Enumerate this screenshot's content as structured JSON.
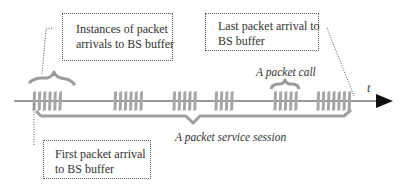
{
  "figure": {
    "type": "timeline-diagram",
    "axis": {
      "label": "t"
    },
    "callouts": {
      "instances": {
        "lines": [
          "Instances of packet",
          "arrivals to BS buffer"
        ]
      },
      "last": {
        "lines": [
          "Last packet arrival to",
          "BS buffer"
        ]
      },
      "first": {
        "lines": [
          "First packet arrival",
          "to BS buffer"
        ]
      }
    },
    "annotations": {
      "packet_call": "A packet call",
      "service_session": "A packet service session"
    },
    "packet_groups": [
      {
        "x_start": 32,
        "count": 6
      },
      {
        "x_start": 113,
        "count": 6
      },
      {
        "x_start": 172,
        "count": 5
      },
      {
        "x_start": 214,
        "count": 4
      },
      {
        "x_start": 273,
        "count": 5
      },
      {
        "x_start": 316,
        "count": 7
      }
    ],
    "colors": {
      "axis": "#333333",
      "packet": "#a6a6a6",
      "brace": "#a0a0a0",
      "text": "#333333",
      "leader": "#555555"
    }
  }
}
